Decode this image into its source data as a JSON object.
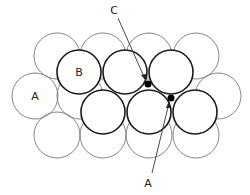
{
  "diagram": {
    "type": "close-packed sphere layers",
    "labels": {
      "layer_a": "A",
      "layer_b": "B",
      "void_c": "C",
      "void_a": "A"
    },
    "colors": {
      "background_stroke": "#777777",
      "foreground_stroke": "#1a1a1a",
      "void_fill": "#000000"
    },
    "background_layer": [
      {
        "cx": 57,
        "cy": 56,
        "r": 23
      },
      {
        "cx": 103,
        "cy": 56,
        "r": 23
      },
      {
        "cx": 149,
        "cy": 56,
        "r": 23
      },
      {
        "cx": 196,
        "cy": 56,
        "r": 23
      },
      {
        "cx": 35,
        "cy": 96,
        "r": 23
      },
      {
        "cx": 80,
        "cy": 96,
        "r": 23
      },
      {
        "cx": 218,
        "cy": 96,
        "r": 23
      },
      {
        "cx": 57,
        "cy": 135,
        "r": 23
      },
      {
        "cx": 103,
        "cy": 135,
        "r": 23
      },
      {
        "cx": 149,
        "cy": 135,
        "r": 23
      },
      {
        "cx": 196,
        "cy": 135,
        "r": 23
      }
    ],
    "foreground_layer": [
      {
        "cx": 79,
        "cy": 72,
        "r": 22
      },
      {
        "cx": 125,
        "cy": 72,
        "r": 22
      },
      {
        "cx": 171,
        "cy": 72,
        "r": 22
      },
      {
        "cx": 103,
        "cy": 112,
        "r": 22
      },
      {
        "cx": 149,
        "cy": 112,
        "r": 22
      },
      {
        "cx": 195,
        "cy": 112,
        "r": 22
      }
    ],
    "voids": [
      {
        "name": "C",
        "cx": 148,
        "cy": 84,
        "r": 3.5
      },
      {
        "name": "A",
        "cx": 171,
        "cy": 98,
        "r": 3.5
      }
    ]
  }
}
